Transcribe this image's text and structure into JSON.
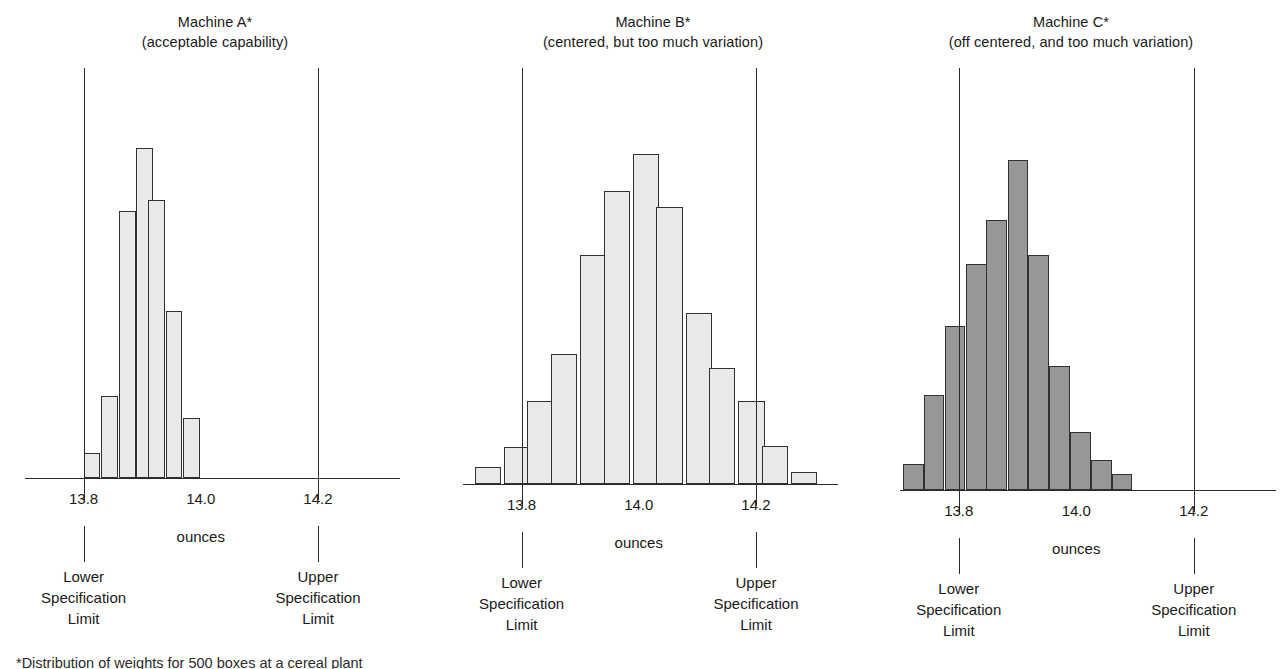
{
  "figure": {
    "footnote": "*Distribution of weights for 500 boxes at a cereal plant"
  },
  "chart_data": [
    {
      "type": "bar",
      "title": "Machine A*",
      "subtitle": "(acceptable capability)",
      "xlabel": "ounces",
      "ylabel": "",
      "grid": false,
      "legend": "none",
      "xlim": [
        13.7,
        14.34
      ],
      "tick_labels": [
        "13.8",
        "14.0",
        "14.2"
      ],
      "tick_values": [
        13.8,
        14.0,
        14.2
      ],
      "lower_spec_limit": 13.8,
      "upper_spec_limit": 14.2,
      "lower_spec_caption": [
        "Lower",
        "Specification",
        "Limit"
      ],
      "upper_spec_caption": [
        "Upper",
        "Specification",
        "Limit"
      ],
      "bin_width": 0.0286,
      "bin_starts": [
        13.8,
        13.83,
        13.86,
        13.89,
        13.91,
        13.94,
        13.97
      ],
      "bar_color": "#e9e9e9",
      "bar_edge_color": "#31312f",
      "values": [
        25,
        82,
        266,
        329,
        277,
        166,
        60
      ]
    },
    {
      "type": "bar",
      "title": "Machine B*",
      "subtitle": "(centered, but too much variation)",
      "xlabel": "ounces",
      "ylabel": "",
      "grid": false,
      "legend": "none",
      "xlim": [
        13.7,
        14.34
      ],
      "tick_labels": [
        "13.8",
        "14.0",
        "14.2"
      ],
      "tick_values": [
        13.8,
        14.0,
        14.2
      ],
      "lower_spec_limit": 13.8,
      "upper_spec_limit": 14.2,
      "lower_spec_caption": [
        "Lower",
        "Specification",
        "Limit"
      ],
      "upper_spec_caption": [
        "Upper",
        "Specification",
        "Limit"
      ],
      "bin_width": 0.045,
      "bin_starts": [
        13.72,
        13.77,
        13.81,
        13.85,
        13.9,
        13.94,
        13.99,
        14.03,
        14.08,
        14.12,
        14.17,
        14.21,
        14.26
      ],
      "bar_color": "#e9e9e9",
      "bar_edge_color": "#31312f",
      "values": [
        14,
        30,
        67,
        105,
        185,
        237,
        267,
        224,
        138,
        94,
        67,
        31,
        10
      ]
    },
    {
      "type": "bar",
      "title": "Machine C*",
      "subtitle": "(off centered, and too much variation)",
      "xlabel": "ounces",
      "ylabel": "",
      "grid": false,
      "legend": "none",
      "xlim": [
        13.7,
        14.34
      ],
      "tick_labels": [
        "13.8",
        "14.0",
        "14.2"
      ],
      "tick_values": [
        13.8,
        14.0,
        14.2
      ],
      "lower_spec_limit": 13.8,
      "upper_spec_limit": 14.2,
      "lower_spec_caption": [
        "Lower",
        "Specification",
        "Limit"
      ],
      "upper_spec_caption": [
        "Upper",
        "Specification",
        "Limit"
      ],
      "bin_width": 0.0355,
      "bin_starts": [
        13.705,
        13.74,
        13.776,
        13.812,
        13.847,
        13.883,
        13.918,
        13.954,
        13.989,
        14.025,
        14.06
      ],
      "bar_color": "#979797",
      "bar_edge_color": "#31312f",
      "values": [
        25,
        92,
        159,
        218,
        261,
        319,
        227,
        120,
        56,
        29,
        15
      ]
    }
  ]
}
